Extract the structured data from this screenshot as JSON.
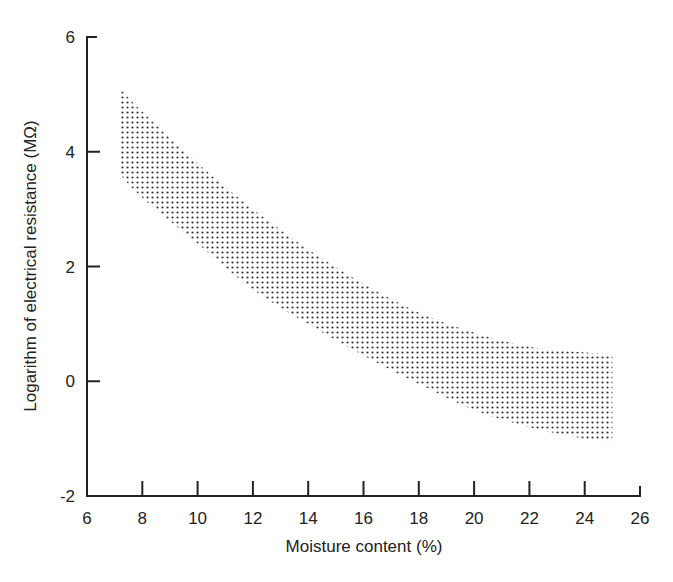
{
  "chart_data": {
    "type": "area",
    "title": "",
    "xlabel": "Moisture content (%)",
    "ylabel": "Logarithm of electrical resistance (MΩ)",
    "xlim": [
      6,
      26
    ],
    "ylim": [
      -2,
      6
    ],
    "x_ticks": [
      6,
      8,
      10,
      12,
      14,
      16,
      18,
      20,
      22,
      24,
      26
    ],
    "y_ticks": [
      -2,
      0,
      2,
      4,
      6
    ],
    "grid": false,
    "legend": null,
    "fill_pattern": "dotted",
    "series": [
      {
        "name": "upper bound",
        "x": [
          7.2,
          8,
          10,
          12,
          14,
          16,
          18,
          20,
          22,
          24,
          25
        ],
        "values": [
          5.1,
          4.7,
          3.8,
          3.0,
          2.3,
          1.7,
          1.2,
          0.85,
          0.6,
          0.5,
          0.48
        ]
      },
      {
        "name": "lower bound",
        "x": [
          7.2,
          8,
          10,
          12,
          14,
          16,
          18,
          20,
          22,
          24,
          25
        ],
        "values": [
          3.6,
          3.2,
          2.4,
          1.6,
          1.0,
          0.45,
          -0.05,
          -0.5,
          -0.8,
          -1.0,
          -1.05
        ]
      }
    ]
  }
}
